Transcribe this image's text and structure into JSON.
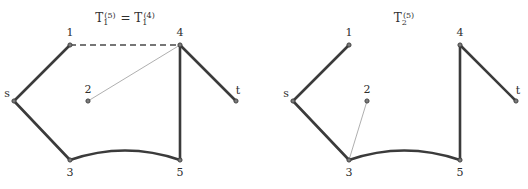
{
  "figure": {
    "background_color": "#ffffff",
    "edge_color": "#3b3b3b",
    "thin_edge_color": "#9a9a9a",
    "node_fill_color": "#7a7a7a",
    "label_color": "#2e2e2e",
    "panels": [
      {
        "id": "left-panel",
        "title": {
          "full_text": "T₁⁽⁵⁾ = T₁⁽⁴⁾",
          "term1_base": "T",
          "term1_sub": "1",
          "term1_sup": "(5)",
          "relation": "=",
          "term2_base": "T",
          "term2_sub": "1",
          "term2_sup": "(4)",
          "x": 125,
          "y": 22
        },
        "nodes": [
          {
            "id": "s",
            "label": "s",
            "x": 14,
            "y": 101,
            "label_x": 7,
            "label_y": 97
          },
          {
            "id": "1",
            "label": "1",
            "x": 70,
            "y": 45,
            "label_x": 70,
            "label_y": 36
          },
          {
            "id": "2",
            "label": "2",
            "x": 88,
            "y": 101,
            "label_x": 88,
            "label_y": 93
          },
          {
            "id": "3",
            "label": "3",
            "x": 70,
            "y": 160,
            "label_x": 70,
            "label_y": 176
          },
          {
            "id": "4",
            "label": "4",
            "x": 180,
            "y": 45,
            "label_x": 180,
            "label_y": 36
          },
          {
            "id": "5",
            "label": "5",
            "x": 180,
            "y": 160,
            "label_x": 180,
            "label_y": 176
          },
          {
            "id": "t",
            "label": "t",
            "x": 236,
            "y": 101,
            "label_x": 238,
            "label_y": 94
          }
        ],
        "edges": [
          {
            "from": "s",
            "to": "1",
            "style": "thick",
            "shape": "line"
          },
          {
            "from": "s",
            "to": "3",
            "style": "thick",
            "shape": "line"
          },
          {
            "from": "1",
            "to": "4",
            "style": "dashed",
            "shape": "line"
          },
          {
            "from": "2",
            "to": "4",
            "style": "thin",
            "shape": "line"
          },
          {
            "from": "3",
            "to": "5",
            "style": "thick",
            "shape": "curve",
            "control_x": 125,
            "control_y": 141
          },
          {
            "from": "4",
            "to": "5",
            "style": "thick",
            "shape": "line"
          },
          {
            "from": "4",
            "to": "t",
            "style": "thick",
            "shape": "line"
          }
        ]
      },
      {
        "id": "right-panel",
        "title": {
          "full_text": "T₂⁽⁵⁾",
          "term1_base": "T",
          "term1_sub": "2",
          "term1_sup": "(5)",
          "relation": "",
          "term2_base": "",
          "term2_sub": "",
          "term2_sup": "",
          "x": 404,
          "y": 22
        },
        "nodes": [
          {
            "id": "s",
            "label": "s",
            "x": 293,
            "y": 101,
            "label_x": 286,
            "label_y": 97
          },
          {
            "id": "1",
            "label": "1",
            "x": 349,
            "y": 45,
            "label_x": 349,
            "label_y": 36
          },
          {
            "id": "2",
            "label": "2",
            "x": 367,
            "y": 101,
            "label_x": 367,
            "label_y": 93
          },
          {
            "id": "3",
            "label": "3",
            "x": 349,
            "y": 160,
            "label_x": 349,
            "label_y": 176
          },
          {
            "id": "4",
            "label": "4",
            "x": 460,
            "y": 45,
            "label_x": 460,
            "label_y": 36
          },
          {
            "id": "5",
            "label": "5",
            "x": 460,
            "y": 160,
            "label_x": 460,
            "label_y": 176
          },
          {
            "id": "t",
            "label": "t",
            "x": 516,
            "y": 101,
            "label_x": 518,
            "label_y": 94
          }
        ],
        "edges": [
          {
            "from": "s",
            "to": "1",
            "style": "thick",
            "shape": "line"
          },
          {
            "from": "s",
            "to": "3",
            "style": "thick",
            "shape": "line"
          },
          {
            "from": "2",
            "to": "3",
            "style": "thin",
            "shape": "line"
          },
          {
            "from": "3",
            "to": "5",
            "style": "thick",
            "shape": "curve",
            "control_x": 404,
            "control_y": 141
          },
          {
            "from": "4",
            "to": "5",
            "style": "thick",
            "shape": "line"
          },
          {
            "from": "4",
            "to": "t",
            "style": "thick",
            "shape": "line"
          }
        ]
      }
    ]
  }
}
